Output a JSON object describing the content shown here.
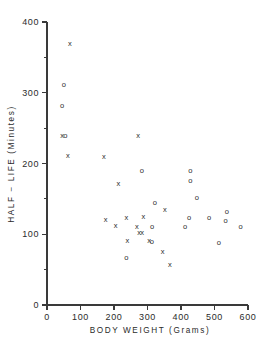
{
  "chart_data": {
    "type": "scatter",
    "title": "",
    "xlabel": "BODY WEIGHT (Grams)",
    "ylabel": "HALF − LIFE (Minutes)",
    "xlim": [
      0,
      600
    ],
    "ylim": [
      0,
      400
    ],
    "xticks": [
      0,
      100,
      200,
      300,
      400,
      500,
      600
    ],
    "yticks": [
      0,
      100,
      200,
      300,
      400
    ],
    "xtick_labels": [
      "0",
      "100",
      "200",
      "300",
      "400",
      "500",
      "600"
    ],
    "ytick_labels": [
      "0",
      "100",
      "200",
      "300",
      "400"
    ],
    "x_minor_ticks": [],
    "y_minor_ticks": [
      50,
      150,
      250,
      350
    ],
    "grid": false,
    "legend": null,
    "legend_position": "none",
    "marker_glyphs": {
      "x": "x",
      "o": "o"
    },
    "series": [
      {
        "name": "x",
        "marker": "x",
        "points": [
          [
            68,
            370
          ],
          [
            45,
            240
          ],
          [
            62,
            212
          ],
          [
            170,
            210
          ],
          [
            272,
            240
          ],
          [
            213,
            172
          ],
          [
            175,
            121
          ],
          [
            205,
            113
          ],
          [
            237,
            124
          ],
          [
            240,
            92
          ],
          [
            268,
            112
          ],
          [
            275,
            103
          ],
          [
            284,
            103
          ],
          [
            288,
            125
          ],
          [
            305,
            91
          ],
          [
            345,
            76
          ],
          [
            352,
            135
          ],
          [
            367,
            57
          ]
        ]
      },
      {
        "name": "o",
        "marker": "o",
        "points": [
          [
            50,
            312
          ],
          [
            45,
            283
          ],
          [
            55,
            240
          ],
          [
            283,
            190
          ],
          [
            322,
            145
          ],
          [
            314,
            112
          ],
          [
            313,
            90
          ],
          [
            237,
            68
          ],
          [
            412,
            112
          ],
          [
            424,
            124
          ],
          [
            428,
            190
          ],
          [
            428,
            177
          ],
          [
            447,
            152
          ],
          [
            484,
            124
          ],
          [
            513,
            89
          ],
          [
            533,
            120
          ],
          [
            537,
            132
          ],
          [
            578,
            111
          ]
        ]
      }
    ]
  }
}
